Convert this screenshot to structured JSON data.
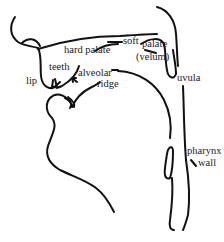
{
  "diagram": {
    "stroke_color": "#111111",
    "background": "#ffffff",
    "labels": {
      "hard_palate": "hard palate",
      "soft": "soft",
      "palate": "palate",
      "velum": "(velum)",
      "lip": "lip",
      "teeth": "teeth",
      "alveolar": "alveolar",
      "ridge": "ridge",
      "uvula": "uvula",
      "pharynx": "pharynx",
      "wall": "wall"
    }
  }
}
